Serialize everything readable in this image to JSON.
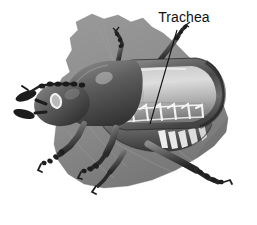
{
  "figure": {
    "kind": "labeled-anatomical-illustration",
    "title": "",
    "background_color": "#ffffff"
  },
  "labels": [
    {
      "id": "trachea",
      "text": "Trachea",
      "text_color": "#111111",
      "text_x": 184,
      "text_y": 22,
      "leader_from_x": 177,
      "leader_from_y": 30,
      "leader_to_x": 150,
      "leader_to_y": 124,
      "leader_color": "#111111"
    }
  ],
  "palette": {
    "background": "#ffffff",
    "leaf_fill": "#8e8e8e",
    "leaf_shadow": "#7b7b7b",
    "leaf_vein": "#9c9c9c",
    "body_dark": "#3a3a3a",
    "body_mid": "#6a6a6a",
    "body_light": "#b8b8b8",
    "elytra_highlight": "#e6e6e6",
    "trachea_white": "#f2f2f2",
    "leg_dark": "#232323",
    "eye_white": "#f5f5f5"
  },
  "anatomy": {
    "parts": [
      "leaf-background",
      "head",
      "antenna",
      "mandible",
      "eye",
      "pronotum",
      "elytra",
      "trachea-tubes",
      "abdomen-segments",
      "foreleg",
      "midleg",
      "hindleg",
      "tarsus"
    ],
    "trachea_tube_count": 7
  }
}
